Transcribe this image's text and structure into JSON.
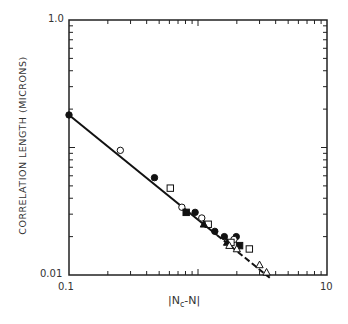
{
  "chart_data": {
    "type": "scatter",
    "title": "",
    "xlabel": "|N_c - N|",
    "ylabel": "CORRELATION LENGTH (MICRONS)",
    "xscale": "log",
    "yscale": "log",
    "xlim": [
      0.1,
      10
    ],
    "ylim": [
      0.01,
      1.0
    ],
    "x_tick_labels": [
      "0.1",
      "1",
      "10"
    ],
    "y_tick_labels": [
      "0.01",
      "1.0"
    ],
    "grid": false,
    "legend": null,
    "fit_line": {
      "style": "solid, dashed at high x",
      "points": [
        [
          0.1,
          0.18
        ],
        [
          3.6,
          0.0095
        ]
      ]
    },
    "series": [
      {
        "name": "filled circle",
        "marker": "circle-filled",
        "points": [
          [
            0.1,
            0.18
          ],
          [
            0.46,
            0.058
          ],
          [
            0.95,
            0.031
          ],
          [
            1.35,
            0.022
          ],
          [
            1.6,
            0.02
          ],
          [
            1.98,
            0.02
          ]
        ]
      },
      {
        "name": "open circle",
        "marker": "circle-open",
        "points": [
          [
            0.25,
            0.095
          ],
          [
            0.75,
            0.034
          ],
          [
            1.07,
            0.028
          ],
          [
            1.9,
            0.019
          ]
        ]
      },
      {
        "name": "open square",
        "marker": "square-open",
        "points": [
          [
            0.61,
            0.048
          ],
          [
            1.2,
            0.025
          ],
          [
            1.8,
            0.018
          ],
          [
            2.5,
            0.016
          ]
        ]
      },
      {
        "name": "filled square",
        "marker": "square-filled",
        "points": [
          [
            0.81,
            0.031
          ],
          [
            2.1,
            0.017
          ]
        ]
      },
      {
        "name": "filled triangle",
        "marker": "triangle-filled",
        "points": [
          [
            1.11,
            0.025
          ],
          [
            1.68,
            0.018
          ]
        ]
      },
      {
        "name": "open triangle",
        "marker": "triangle-open",
        "points": [
          [
            1.75,
            0.017
          ],
          [
            2.0,
            0.016
          ],
          [
            3.0,
            0.012
          ],
          [
            3.4,
            0.0105
          ]
        ]
      }
    ]
  },
  "labels": {
    "y_top": "1.0",
    "y_bottom": "0.01",
    "x_left": "0.1",
    "x_mid": "1",
    "x_right": "10",
    "ylabel": "CORRELATION LENGTH (MICRONS)",
    "xlabel_main": "N",
    "xlabel_sub": "c",
    "xlabel_tail": "-N"
  }
}
